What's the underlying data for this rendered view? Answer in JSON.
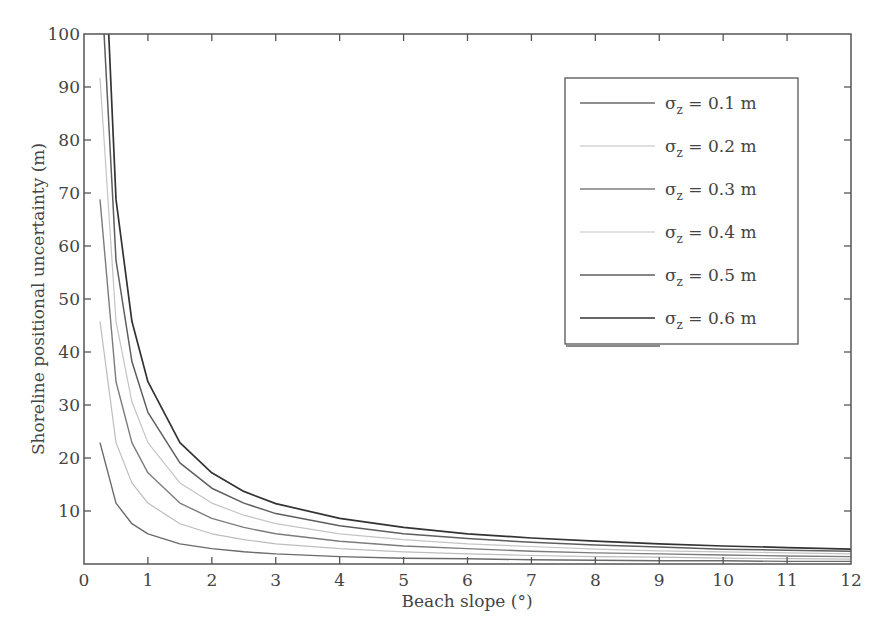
{
  "chart_data": {
    "type": "line",
    "title": "",
    "xlabel": "Beach slope (°)",
    "ylabel": "Shoreline positional uncertainty (m)",
    "xlim": [
      0,
      12
    ],
    "ylim": [
      0,
      100
    ],
    "grid": false,
    "legend_position": "upper right",
    "x_ticks": [
      0,
      1,
      2,
      3,
      4,
      5,
      6,
      7,
      8,
      9,
      10,
      11,
      12
    ],
    "y_ticks": [
      10,
      20,
      30,
      40,
      50,
      60,
      70,
      80,
      90,
      100
    ],
    "formula": "uncertainty = sigma_z / tan(slope)",
    "x": [
      0.25,
      0.5,
      0.75,
      1,
      1.5,
      2,
      2.5,
      3,
      4,
      5,
      6,
      7,
      8,
      9,
      10,
      11,
      12
    ],
    "series": [
      {
        "name": "σz = 0.1 m",
        "sigma": 0.1,
        "color": "#6a6a6a",
        "width": 1.4,
        "values": [
          22.9,
          11.5,
          7.6,
          5.7,
          3.8,
          2.9,
          2.3,
          1.9,
          1.4,
          1.1,
          1.0,
          0.8,
          0.7,
          0.6,
          0.6,
          0.5,
          0.5
        ]
      },
      {
        "name": "σz = 0.2 m",
        "sigma": 0.2,
        "color": "#bdbdbd",
        "width": 1.2,
        "values": [
          45.8,
          22.9,
          15.3,
          11.5,
          7.6,
          5.7,
          4.6,
          3.8,
          2.9,
          2.3,
          1.9,
          1.6,
          1.4,
          1.3,
          1.1,
          1.0,
          0.9
        ]
      },
      {
        "name": "σz = 0.3 m",
        "sigma": 0.3,
        "color": "#7c7c7c",
        "width": 1.4,
        "values": [
          68.8,
          34.4,
          22.9,
          17.2,
          11.5,
          8.6,
          6.9,
          5.7,
          4.3,
          3.4,
          2.9,
          2.4,
          2.1,
          1.9,
          1.7,
          1.5,
          1.4
        ]
      },
      {
        "name": "σz = 0.4 m",
        "sigma": 0.4,
        "color": "#c4c4c4",
        "width": 1.2,
        "values": [
          91.7,
          45.8,
          30.6,
          22.9,
          15.3,
          11.5,
          9.2,
          7.6,
          5.7,
          4.6,
          3.8,
          3.3,
          2.8,
          2.5,
          2.3,
          2.1,
          1.9
        ]
      },
      {
        "name": "σz = 0.5 m",
        "sigma": 0.5,
        "color": "#5e5e5e",
        "width": 1.5,
        "values": [
          114.6,
          57.3,
          38.2,
          28.6,
          19.1,
          14.3,
          11.5,
          9.5,
          7.2,
          5.7,
          4.8,
          4.1,
          3.6,
          3.2,
          2.8,
          2.6,
          2.4
        ]
      },
      {
        "name": "σz = 0.6 m",
        "sigma": 0.6,
        "color": "#333333",
        "width": 1.7,
        "values": [
          137.5,
          68.8,
          45.8,
          34.4,
          22.9,
          17.2,
          13.7,
          11.4,
          8.6,
          6.9,
          5.7,
          4.9,
          4.3,
          3.8,
          3.4,
          3.1,
          2.8
        ]
      }
    ]
  },
  "axes": {
    "x_ticks": [
      "0",
      "1",
      "2",
      "3",
      "4",
      "5",
      "6",
      "7",
      "8",
      "9",
      "10",
      "11",
      "12"
    ],
    "y_ticks": [
      "10",
      "20",
      "30",
      "40",
      "50",
      "60",
      "70",
      "80",
      "90",
      "100"
    ],
    "xlabel": "Beach slope (°)",
    "ylabel": "Shoreline positional uncertainty (m)"
  },
  "legend": {
    "entries": [
      {
        "symbol": "σ",
        "sub": "z",
        "rest": " = 0.1 m"
      },
      {
        "symbol": "σ",
        "sub": "z",
        "rest": " = 0.2 m"
      },
      {
        "symbol": "σ",
        "sub": "z",
        "rest": " = 0.3 m"
      },
      {
        "symbol": "σ",
        "sub": "z",
        "rest": " = 0.4 m"
      },
      {
        "symbol": "σ",
        "sub": "z",
        "rest": " = 0.5 m"
      },
      {
        "symbol": "σ",
        "sub": "z",
        "rest": " = 0.6 m"
      }
    ]
  },
  "colors": {
    "axis": "#555555",
    "text": "#444444",
    "background": "#ffffff"
  }
}
